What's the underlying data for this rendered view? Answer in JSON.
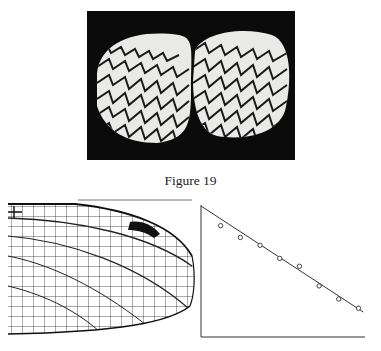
{
  "figure": {
    "caption": "Figure 19",
    "photo_alt": "two cockle shell valves with zigzag stripe pattern on black background",
    "wing_alt": "insect wing venation drawing with dark pterostigma"
  },
  "chart_data": {
    "type": "scatter",
    "title": "",
    "xlabel": "",
    "ylabel": "",
    "xlim": [
      0,
      10
    ],
    "ylim": [
      0,
      10
    ],
    "grid": false,
    "legend": null,
    "x": [
      1.2,
      2.4,
      3.6,
      4.8,
      6.0,
      7.2,
      8.4,
      9.6
    ],
    "y": [
      8.5,
      7.6,
      7.0,
      6.0,
      5.4,
      3.9,
      2.9,
      2.2
    ],
    "fit_line": {
      "x": [
        0,
        9.9
      ],
      "y": [
        10,
        1.9
      ]
    },
    "marker": "open-circle"
  }
}
